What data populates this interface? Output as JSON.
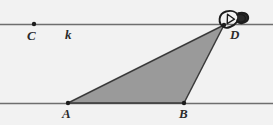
{
  "figure": {
    "background_color": "#f2f2f2",
    "line_color": "#6e6e6e",
    "stroke_color": "#3a3a3a",
    "triangle_fill": "#9a9a9a",
    "annotation_color": "#1c1c1c"
  },
  "labels": {
    "point_c": "C",
    "line_k": "k",
    "point_d": "D",
    "point_a": "A",
    "point_b": "B"
  },
  "geometry": {
    "upper_line": {
      "name": "k",
      "y": 24,
      "x_start": 0,
      "x_end": 273
    },
    "lower_line": {
      "name": "m",
      "y": 103,
      "x_start": 0,
      "x_end": 273
    },
    "points": [
      {
        "id": "C",
        "x": 34,
        "y": 24,
        "on_line": "k",
        "label_pos": "below"
      },
      {
        "id": "D",
        "x": 224,
        "y": 25,
        "on_line": "k",
        "label_pos": "below-right"
      },
      {
        "id": "A",
        "x": 68,
        "y": 103,
        "on_line": "m",
        "label_pos": "below"
      },
      {
        "id": "B",
        "x": 184,
        "y": 103,
        "on_line": "m",
        "label_pos": "below"
      }
    ],
    "triangle": {
      "vertices": [
        "A",
        "B",
        "D"
      ],
      "shaded": true
    }
  },
  "annotation": {
    "type": "hand-drawn-marker",
    "name": "scribble-marker-at-D",
    "target_point": "D",
    "x": 224,
    "y": 16
  }
}
